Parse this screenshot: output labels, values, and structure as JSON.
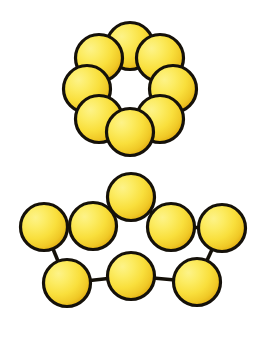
{
  "figure": {
    "title": "Sulfur allotrope sphere models",
    "background_color": "#ffffff",
    "width": 271,
    "height": 344,
    "atom": {
      "radius": 23.5,
      "outline_color": "#15110a",
      "outline_width": 3.2,
      "fill_light": "#fdef6a",
      "fill_mid": "#f8df40",
      "fill_deep": "#e8b318",
      "highlight_offset_x": -0.3,
      "highlight_offset_y": -0.32
    },
    "bond": {
      "color": "#141008",
      "width": 3.6
    }
  },
  "chart_data": {
    "type": "diagram",
    "title": "Sulfur allotrope sphere models",
    "structures": [
      {
        "name": "cyclo-octasulfur-ring",
        "label": "S8 ring",
        "atom_count": 8,
        "layout": "closed ring (crown), eight touching spheres",
        "center": [
          130,
          89
        ],
        "ring_radius": 43,
        "atoms": [
          {
            "id": "r1",
            "cx": 130,
            "cy": 46
          },
          {
            "id": "r2",
            "cx": 160,
            "cy": 58
          },
          {
            "id": "r3",
            "cx": 173,
            "cy": 89
          },
          {
            "id": "r4",
            "cx": 160,
            "cy": 119
          },
          {
            "id": "r5",
            "cx": 130,
            "cy": 132
          },
          {
            "id": "r6",
            "cx": 99,
            "cy": 119
          },
          {
            "id": "r7",
            "cx": 87,
            "cy": 89
          },
          {
            "id": "r8",
            "cx": 99,
            "cy": 58
          }
        ],
        "bonds": [],
        "draw_order": [
          "r1",
          "r8",
          "r2",
          "r7",
          "r3",
          "r6",
          "r4",
          "r5"
        ]
      },
      {
        "name": "catena-octasulfur-chain",
        "label": "S8 open chain",
        "atom_count": 8,
        "layout": "open zig-zag chain with visible bond lines",
        "atoms": [
          {
            "id": "c1",
            "cx": 44,
            "cy": 227
          },
          {
            "id": "c2",
            "cx": 93,
            "cy": 226
          },
          {
            "id": "c3",
            "cx": 131,
            "cy": 197
          },
          {
            "id": "c4",
            "cx": 171,
            "cy": 227
          },
          {
            "id": "c5",
            "cx": 222,
            "cy": 228
          },
          {
            "id": "c6",
            "cx": 197,
            "cy": 282
          },
          {
            "id": "c7",
            "cx": 131,
            "cy": 276
          },
          {
            "id": "c8",
            "cx": 67,
            "cy": 283
          }
        ],
        "bonds": [
          {
            "from": "c2",
            "to": "c1"
          },
          {
            "from": "c1",
            "to": "c8"
          },
          {
            "from": "c8",
            "to": "c7"
          },
          {
            "from": "c7",
            "to": "c6"
          },
          {
            "from": "c6",
            "to": "c5"
          },
          {
            "from": "c5",
            "to": "c4"
          },
          {
            "from": "c3",
            "to": "c2"
          },
          {
            "from": "c3",
            "to": "c4"
          }
        ],
        "draw_order": [
          "c3",
          "c2",
          "c4",
          "c1",
          "c5",
          "c8",
          "c7",
          "c6"
        ]
      }
    ]
  }
}
